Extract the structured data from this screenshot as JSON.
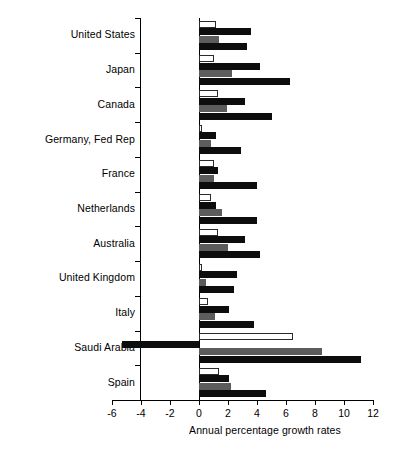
{
  "chart_data": {
    "type": "bar",
    "orientation": "horizontal",
    "title": "",
    "subtitle": "",
    "xlabel": "Annual percentage growth rates",
    "ylabel": "",
    "xlim": [
      -6,
      12
    ],
    "xticks": [
      -6,
      -4,
      -2,
      0,
      2,
      4,
      6,
      8,
      10,
      12
    ],
    "xtick_labels": [
      "-6",
      "-4",
      "-2",
      "0",
      "2",
      "4",
      "6",
      "8",
      "10",
      "12"
    ],
    "grid": false,
    "legend": false,
    "legend_position": "none",
    "categories": [
      "United States",
      "Japan",
      "Canada",
      "Germany, Fed Rep",
      "France",
      "Netherlands",
      "Australia",
      "United Kingdom",
      "Italy",
      "Saudi Arabia",
      "Spain"
    ],
    "series": [
      {
        "name": "series-1",
        "color": "#ffffff",
        "fill": "white-outlined",
        "values": [
          1.2,
          1.0,
          1.3,
          0.2,
          1.0,
          0.8,
          1.3,
          0.2,
          0.6,
          6.5,
          1.4
        ]
      },
      {
        "name": "series-2",
        "color": "#0d0d0d",
        "fill": "black",
        "values": [
          3.6,
          4.2,
          3.2,
          1.2,
          1.3,
          1.2,
          3.2,
          2.6,
          2.1,
          -5.3,
          2.1
        ]
      },
      {
        "name": "series-3",
        "color": "#5c5c5c",
        "fill": "gray",
        "values": [
          1.4,
          2.3,
          1.9,
          0.8,
          1.0,
          1.6,
          2.0,
          0.5,
          1.1,
          8.5,
          2.2
        ]
      },
      {
        "name": "series-4",
        "color": "#0d0d0d",
        "fill": "black",
        "values": [
          3.3,
          6.3,
          5.0,
          2.9,
          4.0,
          4.0,
          4.2,
          2.4,
          3.8,
          11.2,
          4.6
        ]
      }
    ]
  }
}
